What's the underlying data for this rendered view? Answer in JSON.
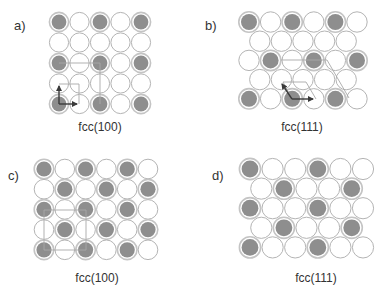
{
  "figure": {
    "colors": {
      "atom_filled": "#8e8e8e",
      "atom_filled_ring": "#c4c4c4",
      "atom_empty_stroke": "#b4b4b4",
      "atom_empty_fill": "#ffffff",
      "guide_line": "#a8a8a8",
      "arrow": "#3a3a3a",
      "text": "#333333"
    },
    "panels": [
      {
        "id": "a",
        "label": "a)",
        "caption": "fcc(100)",
        "label_pos": [
          14,
          30
        ],
        "caption_pos": [
          100,
          131
        ],
        "lattice": "square",
        "origin": [
          59,
          22
        ],
        "dx": 20.5,
        "dy": 20.5,
        "radius": 9.6,
        "rows": [
          {
            "offset": 0,
            "atoms": [
              1,
              0,
              1,
              0,
              1
            ]
          },
          {
            "offset": 0,
            "atoms": [
              0,
              0,
              0,
              0,
              0
            ]
          },
          {
            "offset": 0,
            "atoms": [
              1,
              0,
              1,
              0,
              1
            ]
          },
          {
            "offset": 0,
            "atoms": [
              0,
              0,
              0,
              0,
              0
            ]
          },
          {
            "offset": 0,
            "atoms": [
              1,
              0,
              1,
              0,
              1
            ]
          }
        ],
        "guides": [
          [
            [
              59,
              63
            ],
            [
              100,
              63
            ]
          ],
          [
            [
              100,
              63
            ],
            [
              100,
              104
            ]
          ],
          [
            [
              59,
              84
            ],
            [
              79,
              84
            ]
          ],
          [
            [
              79,
              84
            ],
            [
              79,
              104
            ]
          ]
        ],
        "arrows": [
          [
            [
              59,
              104
            ],
            [
              59,
              86
            ]
          ],
          [
            [
              59,
              104
            ],
            [
              77,
              104
            ]
          ]
        ]
      },
      {
        "id": "b",
        "label": "b)",
        "caption": "fcc(111)",
        "label_pos": [
          205,
          30
        ],
        "caption_pos": [
          302,
          131
        ],
        "lattice": "hexagonal",
        "origin": [
          249,
          22
        ],
        "dx": 21.6,
        "dy": 19.2,
        "radius": 10.2,
        "rows": [
          {
            "offset": 0,
            "atoms": [
              1,
              0,
              1,
              0,
              1,
              0
            ]
          },
          {
            "offset": 0.5,
            "atoms": [
              0,
              0,
              0,
              0,
              0
            ]
          },
          {
            "offset": 0,
            "atoms": [
              0,
              1,
              0,
              1,
              0,
              1
            ]
          },
          {
            "offset": 0.5,
            "atoms": [
              0,
              0,
              0,
              0,
              0
            ]
          },
          {
            "offset": 0,
            "atoms": [
              1,
              0,
              1,
              0,
              1,
              0
            ]
          }
        ],
        "guides": [
          [
            [
              281,
              60
            ],
            [
              327,
              60
            ]
          ],
          [
            [
              327,
              60
            ],
            [
              349,
              98
            ]
          ],
          [
            [
              283,
              82
            ],
            [
              306,
              82
            ]
          ],
          [
            [
              306,
              82
            ],
            [
              316,
              99
            ]
          ],
          [
            [
              283,
              82
            ],
            [
              292,
              99
            ]
          ]
        ],
        "arrows": [
          [
            [
              292,
              99
            ],
            [
              282,
              84
            ]
          ],
          [
            [
              292,
              99
            ],
            [
              313,
              99
            ]
          ]
        ]
      },
      {
        "id": "c",
        "label": "c)",
        "caption": "fcc(100)",
        "label_pos": [
          8,
          180
        ],
        "caption_pos": [
          97,
          282
        ],
        "lattice": "square",
        "origin": [
          44,
          169
        ],
        "dx": 20.8,
        "dy": 20.2,
        "radius": 9.8,
        "rows": [
          {
            "offset": 0,
            "atoms": [
              1,
              0,
              1,
              0,
              1,
              0
            ]
          },
          {
            "offset": 0,
            "atoms": [
              0,
              1,
              0,
              1,
              0,
              1
            ]
          },
          {
            "offset": 0,
            "atoms": [
              1,
              0,
              1,
              0,
              1,
              0
            ]
          },
          {
            "offset": 0,
            "atoms": [
              0,
              1,
              0,
              1,
              0,
              1
            ]
          },
          {
            "offset": 0,
            "atoms": [
              1,
              0,
              1,
              0,
              1,
              0
            ]
          }
        ],
        "guides": [
          [
            [
              44,
              210
            ],
            [
              86,
              210
            ]
          ],
          [
            [
              86,
              210
            ],
            [
              86,
              250
            ]
          ],
          [
            [
              86,
              250
            ],
            [
              44,
              250
            ]
          ],
          [
            [
              44,
              250
            ],
            [
              44,
              210
            ]
          ]
        ],
        "arrows": []
      },
      {
        "id": "d",
        "label": "d)",
        "caption": "fcc(111)",
        "label_pos": [
          212,
          180
        ],
        "caption_pos": [
          316,
          282
        ],
        "lattice": "hexagonal",
        "origin": [
          250,
          169
        ],
        "dx": 22.6,
        "dy": 19.6,
        "radius": 10.6,
        "rows": [
          {
            "offset": 0,
            "atoms": [
              1,
              0,
              0,
              1,
              0,
              0
            ]
          },
          {
            "offset": 0.5,
            "atoms": [
              0,
              1,
              0,
              0,
              1
            ]
          },
          {
            "offset": 0,
            "atoms": [
              1,
              0,
              0,
              1,
              0,
              0
            ]
          },
          {
            "offset": 0.5,
            "atoms": [
              0,
              1,
              0,
              0,
              1
            ]
          },
          {
            "offset": 0,
            "atoms": [
              1,
              0,
              0,
              1,
              0,
              0
            ]
          }
        ],
        "guides": [],
        "arrows": []
      }
    ]
  }
}
